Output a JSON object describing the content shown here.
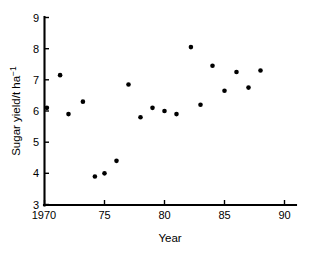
{
  "chart_data": {
    "type": "scatter",
    "title": "",
    "xlabel": "Year",
    "ylabel": "Sugar yield/t ha⁻¹",
    "xlim": [
      1970,
      90.5
    ],
    "ylim": [
      3,
      9
    ],
    "grid": false,
    "legend": "none",
    "marker": {
      "shape": "circle",
      "color": "#000000",
      "size_px": 4.6
    },
    "xticks": [
      1970,
      1975,
      1980,
      1985,
      1990
    ],
    "xtick_labels": [
      "1970",
      "75",
      "80",
      "85",
      "90"
    ],
    "yticks": [
      3,
      4,
      5,
      6,
      7,
      8,
      9
    ],
    "ytick_labels": [
      "3",
      "4",
      "5",
      "6",
      "7",
      "8",
      "9"
    ],
    "x": [
      1970.2,
      1971.3,
      1972.0,
      1973.2,
      1974.2,
      1975.0,
      1976.0,
      1977.0,
      1978.0,
      1979.0,
      1980.0,
      1981.0,
      1982.2,
      1983.0,
      1984.0,
      1985.0,
      1986.0,
      1987.0,
      1988.0
    ],
    "y": [
      6.1,
      7.15,
      5.9,
      6.3,
      3.9,
      4.0,
      4.4,
      6.85,
      5.8,
      6.1,
      6.0,
      5.9,
      8.05,
      6.2,
      7.45,
      6.65,
      7.25,
      6.75,
      7.3
    ],
    "points": [
      {
        "x": 1970.2,
        "y": 6.1
      },
      {
        "x": 1971.3,
        "y": 7.15
      },
      {
        "x": 1972.0,
        "y": 5.9
      },
      {
        "x": 1973.2,
        "y": 6.3
      },
      {
        "x": 1974.2,
        "y": 3.9
      },
      {
        "x": 1975.0,
        "y": 4.0
      },
      {
        "x": 1976.0,
        "y": 4.4
      },
      {
        "x": 1977.0,
        "y": 6.85
      },
      {
        "x": 1978.0,
        "y": 5.8
      },
      {
        "x": 1979.0,
        "y": 6.1
      },
      {
        "x": 1980.0,
        "y": 6.0
      },
      {
        "x": 1981.0,
        "y": 5.9
      },
      {
        "x": 1982.2,
        "y": 8.05
      },
      {
        "x": 1983.0,
        "y": 6.2
      },
      {
        "x": 1984.0,
        "y": 7.45
      },
      {
        "x": 1985.0,
        "y": 6.65
      },
      {
        "x": 1986.0,
        "y": 7.25
      },
      {
        "x": 1987.0,
        "y": 6.75
      },
      {
        "x": 1988.0,
        "y": 7.3
      }
    ]
  },
  "axes": {
    "x_title": "Year",
    "y_title_main": "Sugar yield/t ha",
    "y_title_sup": "−1"
  },
  "colors": {
    "background": "#ffffff",
    "foreground": "#000000",
    "marker": "#000000"
  }
}
